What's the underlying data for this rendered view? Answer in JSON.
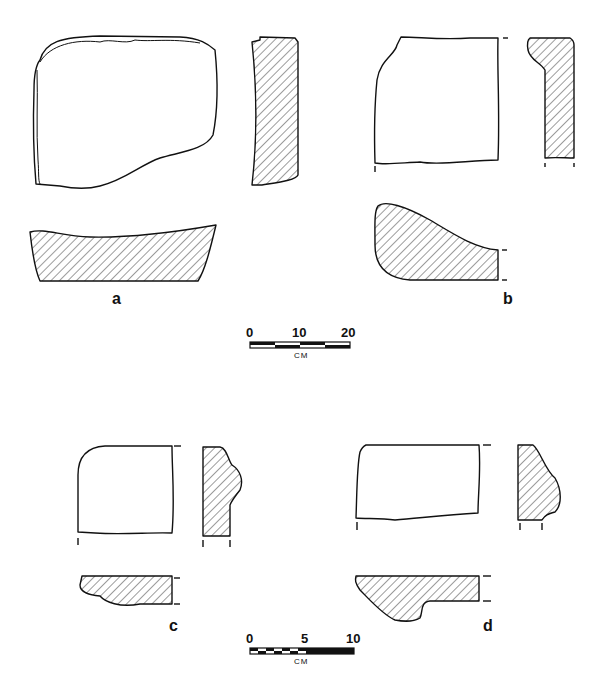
{
  "figure": {
    "specimens": [
      {
        "id": "a",
        "label": "a",
        "views": [
          "plan",
          "section-side",
          "section-end"
        ]
      },
      {
        "id": "b",
        "label": "b",
        "views": [
          "plan",
          "section-side",
          "section-end"
        ]
      },
      {
        "id": "c",
        "label": "c",
        "views": [
          "plan",
          "section-side",
          "section-end"
        ]
      },
      {
        "id": "d",
        "label": "d",
        "views": [
          "plan",
          "section-side",
          "section-end"
        ]
      }
    ],
    "scale_bars": [
      {
        "id": "top",
        "ticks": [
          "0",
          "10",
          "20"
        ],
        "unit": "CM"
      },
      {
        "id": "bottom",
        "ticks": [
          "0",
          "5",
          "10"
        ],
        "unit": "CM"
      }
    ],
    "colors": {
      "ink": "#111111",
      "background": "#ffffff"
    }
  }
}
